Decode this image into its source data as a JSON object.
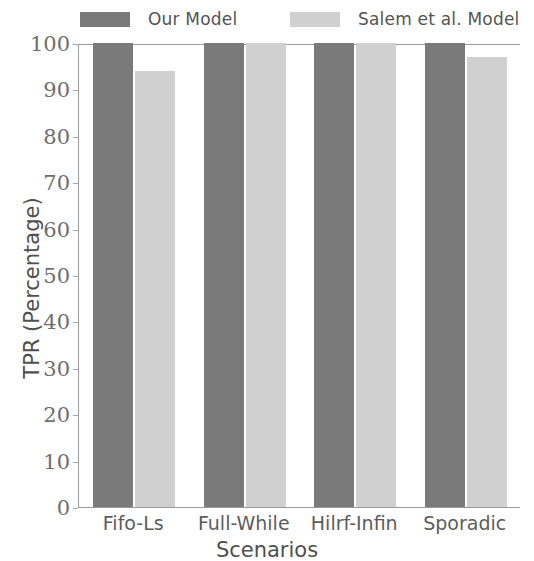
{
  "chart_data": {
    "type": "bar",
    "title": "",
    "xlabel": "Scenarios",
    "ylabel": "TPR (Percentage)",
    "categories": [
      "Fifo-Ls",
      "Full-While",
      "Hilrf-Infin",
      "Sporadic"
    ],
    "series": [
      {
        "name": "Our Model",
        "color": "#7a7a7a",
        "values": [
          100,
          100,
          100,
          100
        ]
      },
      {
        "name": "Salem et al. Model",
        "color": "#d0d0d0",
        "values": [
          94,
          100,
          100,
          97
        ]
      }
    ],
    "ylim": [
      0,
      100
    ],
    "yticks": [
      0,
      10,
      20,
      30,
      40,
      50,
      60,
      70,
      80,
      90,
      100
    ],
    "ytick_labels": [
      "0",
      "10",
      "20",
      "30",
      "40",
      "50",
      "60",
      "70",
      "80",
      "90",
      "100"
    ],
    "grid": false,
    "legend_position": "top"
  }
}
